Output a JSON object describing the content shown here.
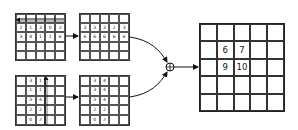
{
  "diagram": {
    "top_input": {
      "rows": [
        [
          "",
          "",
          "",
          "",
          ""
        ],
        [
          "2",
          "1",
          "3",
          "0",
          "2"
        ],
        [
          "3",
          "4",
          "1",
          "1",
          "6"
        ],
        [
          "",
          "",
          "",
          "",
          ""
        ],
        [
          "",
          "",
          "",
          "",
          ""
        ]
      ],
      "arrow": "horizontal-left-along-row-1"
    },
    "top_output": {
      "rows": [
        [
          "",
          "",
          "",
          "",
          ""
        ],
        [
          "3",
          "3",
          "3",
          "2",
          "3"
        ],
        [
          "6",
          "6",
          "6",
          "6",
          "6"
        ],
        [
          "",
          "",
          "",
          "",
          ""
        ],
        [
          "",
          "",
          "",
          "",
          ""
        ]
      ]
    },
    "bottom_input": {
      "rows": [
        [
          "",
          "3",
          "1",
          "",
          ""
        ],
        [
          "",
          "1",
          "1",
          "",
          ""
        ],
        [
          "",
          "3",
          "4",
          "",
          ""
        ],
        [
          "",
          "2",
          "2",
          "",
          ""
        ],
        [
          "",
          "0",
          "2",
          "",
          ""
        ]
      ],
      "arrow": "vertical-up-along-column-4"
    },
    "bottom_output": {
      "rows": [
        [
          "",
          "3",
          "4",
          "",
          ""
        ],
        [
          "",
          "3",
          "4",
          "",
          ""
        ],
        [
          "",
          "3",
          "4",
          "",
          ""
        ],
        [
          "",
          "2",
          "2",
          "",
          ""
        ],
        [
          "",
          "0",
          "2",
          "",
          ""
        ]
      ]
    },
    "combine_operator": "⊕",
    "result": {
      "rows": [
        [
          "",
          "",
          "",
          "",
          ""
        ],
        [
          "",
          "6",
          "7",
          "",
          ""
        ],
        [
          "",
          "9",
          "10",
          "",
          ""
        ],
        [
          "",
          "",
          "",
          "",
          ""
        ],
        [
          "",
          "",
          "",
          "",
          ""
        ]
      ]
    }
  }
}
